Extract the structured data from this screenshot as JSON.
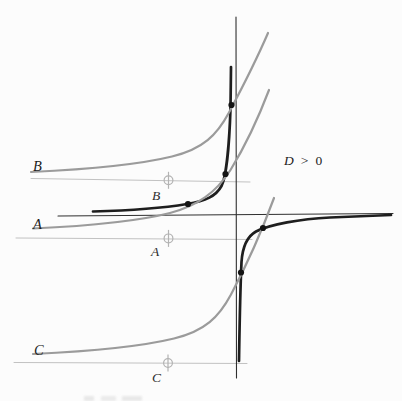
{
  "figure": {
    "condition": {
      "lhs": "D",
      "op": ">",
      "rhs": "0"
    },
    "labels": {
      "curve_b": "B",
      "curve_a": "A",
      "curve_c": "C",
      "marker_b": "B",
      "marker_a": "A",
      "marker_c": "C"
    },
    "colors": {
      "axis": "#2f2f2f",
      "dark_curve": "#1e1e1e",
      "gray_curve": "#9b9b9b",
      "asymptote_line": "#c2c2c2",
      "marker": "#b3b3b3",
      "dot": "#141414"
    },
    "geometry": {
      "axes": [
        {
          "name": "x-axis",
          "x1": 58,
          "y1": 216,
          "x2": 393,
          "y2": 213.5,
          "color": "axis",
          "width": 1.1
        },
        {
          "name": "y-axis",
          "x1": 236,
          "y1": 17,
          "x2": 236.5,
          "y2": 378,
          "color": "axis",
          "width": 1.1
        }
      ],
      "asymptote_lines": [
        {
          "name": "asymptote-line-b",
          "x1": 31,
          "y1": 178.5,
          "x2": 250,
          "y2": 182,
          "color": "asymptote_line",
          "width": 1
        },
        {
          "name": "asymptote-line-a",
          "x1": 16,
          "y1": 238,
          "x2": 252,
          "y2": 239.5,
          "color": "asymptote_line",
          "width": 1
        },
        {
          "name": "asymptote-line-c",
          "x1": 14,
          "y1": 362.5,
          "x2": 247,
          "y2": 363.5,
          "color": "asymptote_line",
          "width": 1
        }
      ],
      "curves": [
        {
          "name": "hyperbola-upper-branch",
          "d": "M 93 211.5 C 128 210.5, 163 208, 187 204 C 206 201, 216 196, 221.5 186 C 226.5 176.5, 229.5 140, 230.5 108 L 231 67",
          "color": "dark_curve",
          "width": 2.7
        },
        {
          "name": "hyperbola-lower-branch",
          "d": "M 239 361 C 239.5 330, 240 295, 241.5 262 C 242.5 247, 247 236.5, 256 231.5 C 270 224.5, 300 219, 330 217.5 C 355 216.5, 375 215.5, 391 215",
          "color": "dark_curve",
          "width": 2.7
        },
        {
          "name": "curve-b",
          "d": "M 31 172 C 85 169.5, 135 165.5, 172 156.5 C 203 149, 217 135, 229 112.5 C 241 90, 255.5 62, 268 33",
          "color": "gray_curve",
          "width": 2.2
        },
        {
          "name": "curve-a",
          "d": "M 33 228.5 C 87 226, 135 222, 170 213 C 198 205.5, 216 192.5, 230.5 170 C 244 148, 258 119, 269 90",
          "color": "gray_curve",
          "width": 2.2
        },
        {
          "name": "curve-c",
          "d": "M 33 354 C 87 351.5, 137 347.5, 174 338.5 C 205 331, 219 317, 231 294.5 C 243 272, 260 236, 274 198",
          "color": "gray_curve",
          "width": 2.2
        }
      ],
      "markers": [
        {
          "name": "crosshair-marker-b",
          "x": 168.5,
          "y": 180.3
        },
        {
          "name": "crosshair-marker-a",
          "x": 168.5,
          "y": 238.4
        },
        {
          "name": "crosshair-marker-c",
          "x": 168,
          "y": 363
        }
      ],
      "marker_style": {
        "radius": 4.4,
        "tick_half_len": 8.5,
        "width": 1.2
      },
      "dots": [
        {
          "name": "intersection-dot-1",
          "x": 188,
          "y": 204
        },
        {
          "name": "intersection-dot-2",
          "x": 225.5,
          "y": 174
        },
        {
          "name": "intersection-dot-3",
          "x": 231.5,
          "y": 105
        },
        {
          "name": "intersection-dot-4",
          "x": 263,
          "y": 228
        },
        {
          "name": "intersection-dot-5",
          "x": 241,
          "y": 272.5
        }
      ],
      "dot_radius": 3.1
    }
  }
}
